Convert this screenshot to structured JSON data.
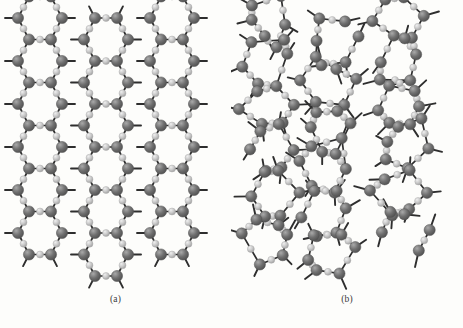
{
  "figure": {
    "background_color": "#fdfdfb",
    "width": 463,
    "height": 328,
    "type": "structure-diagram"
  },
  "atoms": {
    "large": {
      "name": "silicon-atom",
      "radius": 5.6,
      "fill": "#6f6f6f",
      "highlight": "#a9a9a9",
      "shadow": "#4d4d4d"
    },
    "small": {
      "name": "oxygen-atom",
      "radius": 3.5,
      "fill": "#c9c9c9",
      "highlight": "#efefef",
      "shadow": "#9a9a9a"
    }
  },
  "bonds": {
    "color": "#2e2e2e",
    "width": 1.7,
    "stub_color": "#2e2e2e",
    "stub_width": 1.9
  },
  "panels": [
    {
      "id": "a",
      "caption": "(a)",
      "order": "crystalline",
      "description": "Regular repeating hexagonal lattice"
    },
    {
      "id": "b",
      "caption": "(b)",
      "order": "amorphous",
      "description": "Irregular random network of 5-, 6- and 7-member rings"
    }
  ],
  "chart_data": {
    "type": "scatter",
    "title": "",
    "xlabel": "",
    "ylabel": "",
    "panel_a": {
      "label": "(a)",
      "lattice": "hexagonal",
      "rows": 6,
      "columns": 4,
      "cell_width": 44,
      "cell_height": 43,
      "origin_x": 40,
      "origin_y": 18,
      "large_atom_count": 62,
      "small_atom_count": 52
    },
    "panel_b": {
      "label": "(b)",
      "lattice": "random-network",
      "ring_sizes": [
        5,
        6,
        6,
        7,
        6,
        5,
        7,
        6
      ],
      "large_atom_count": 66,
      "small_atom_count": 58
    }
  }
}
